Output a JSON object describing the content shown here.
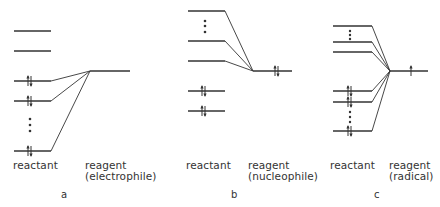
{
  "figure": {
    "line_color": "#333333",
    "panels": [
      {
        "id": "a",
        "letter": "a",
        "reactant_label": "reactant",
        "reagent_label": "reagent",
        "reagent_type": "(electrophile)",
        "reactant_levels": [
          {
            "y": 31,
            "occupied": false
          },
          {
            "y": 51,
            "occupied": false
          },
          {
            "y": 81,
            "occupied": true
          },
          {
            "y": 101,
            "occupied": true
          },
          {
            "y": 151,
            "occupied": true
          }
        ],
        "reagent_level": {
          "y": 71,
          "electrons": "empty"
        },
        "ellipsis_between": "occupied levels"
      },
      {
        "id": "b",
        "letter": "b",
        "reactant_label": "reactant",
        "reagent_label": "reagent",
        "reagent_type": "(nucleophile)",
        "reactant_levels": [
          {
            "y": 11,
            "occupied": false
          },
          {
            "y": 41,
            "occupied": false
          },
          {
            "y": 61,
            "occupied": false
          },
          {
            "y": 91,
            "occupied": true
          },
          {
            "y": 111,
            "occupied": true
          }
        ],
        "reagent_level": {
          "y": 71,
          "electrons": "pair"
        },
        "ellipsis_between": "unoccupied levels"
      },
      {
        "id": "c",
        "letter": "c",
        "reactant_label": "reactant",
        "reagent_label": "reagent",
        "reagent_type": "(radical)",
        "reactant_levels": [
          {
            "y": 26,
            "occupied": false
          },
          {
            "y": 42,
            "occupied": false
          },
          {
            "y": 52,
            "occupied": false
          },
          {
            "y": 91,
            "occupied": true
          },
          {
            "y": 102,
            "occupied": true
          },
          {
            "y": 131,
            "occupied": true
          }
        ],
        "reagent_level": {
          "y": 71,
          "electrons": "single"
        },
        "ellipsis_between": "both"
      }
    ]
  }
}
